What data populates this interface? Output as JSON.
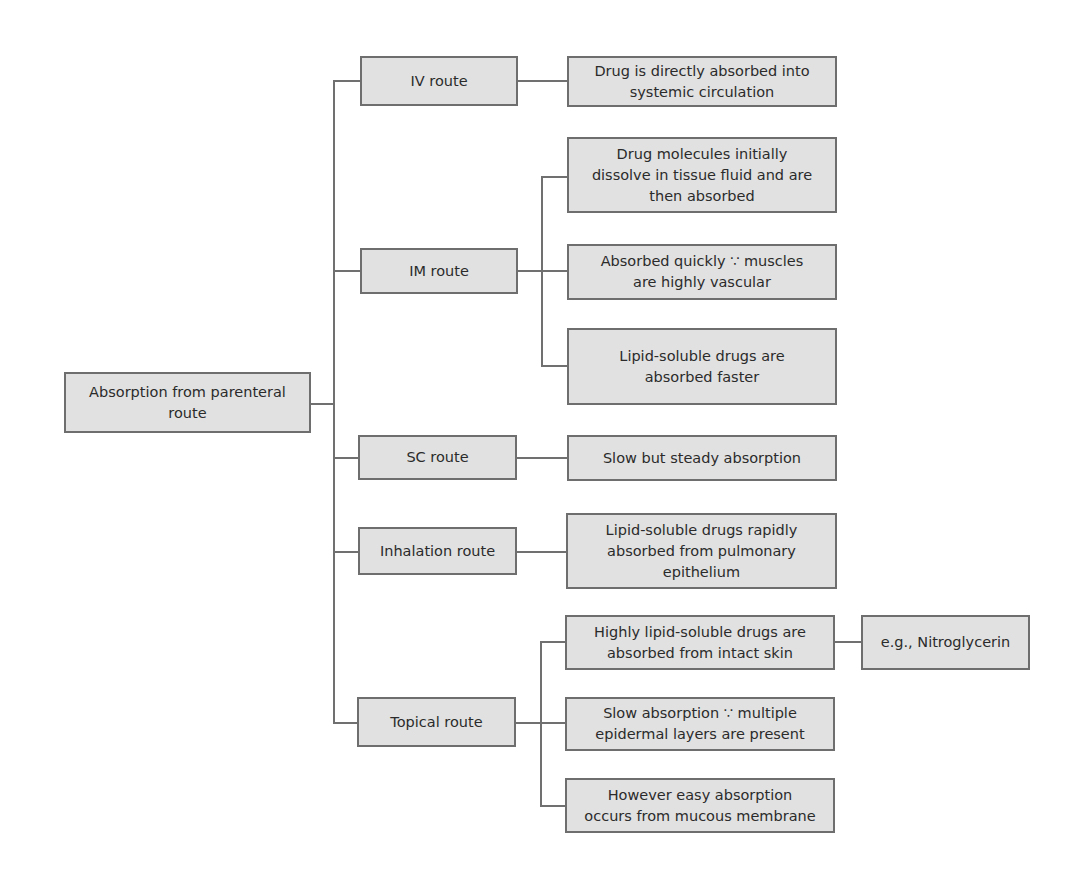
{
  "diagram": {
    "type": "tree",
    "root": {
      "label": "Absorption from parenteral\nroute"
    },
    "routes": [
      {
        "label": "IV route",
        "details": [
          {
            "label": "Drug is directly absorbed into\nsystemic circulation"
          }
        ]
      },
      {
        "label": "IM route",
        "details": [
          {
            "label": "Drug molecules initially\ndissolve in tissue fluid and are\nthen absorbed"
          },
          {
            "label": "Absorbed quickly ∵ muscles\nare highly vascular"
          },
          {
            "label": "Lipid-soluble drugs are\nabsorbed faster"
          }
        ]
      },
      {
        "label": "SC route",
        "details": [
          {
            "label": "Slow but steady absorption"
          }
        ]
      },
      {
        "label": "Inhalation route",
        "details": [
          {
            "label": "Lipid-soluble drugs rapidly\nabsorbed from pulmonary\nepithelium"
          }
        ]
      },
      {
        "label": "Topical route",
        "details": [
          {
            "label": "Highly lipid-soluble drugs are\nabsorbed from intact skin",
            "example": "e.g., Nitroglycerin"
          },
          {
            "label": "Slow absorption ∵ multiple\nepidermal layers are present"
          },
          {
            "label": "However easy absorption\noccurs from mucous membrane"
          }
        ]
      }
    ],
    "colors": {
      "box_fill": "#e1e1e1",
      "box_border": "#6e6e6e",
      "connector": "#707070",
      "text": "#2b2b2b"
    }
  }
}
